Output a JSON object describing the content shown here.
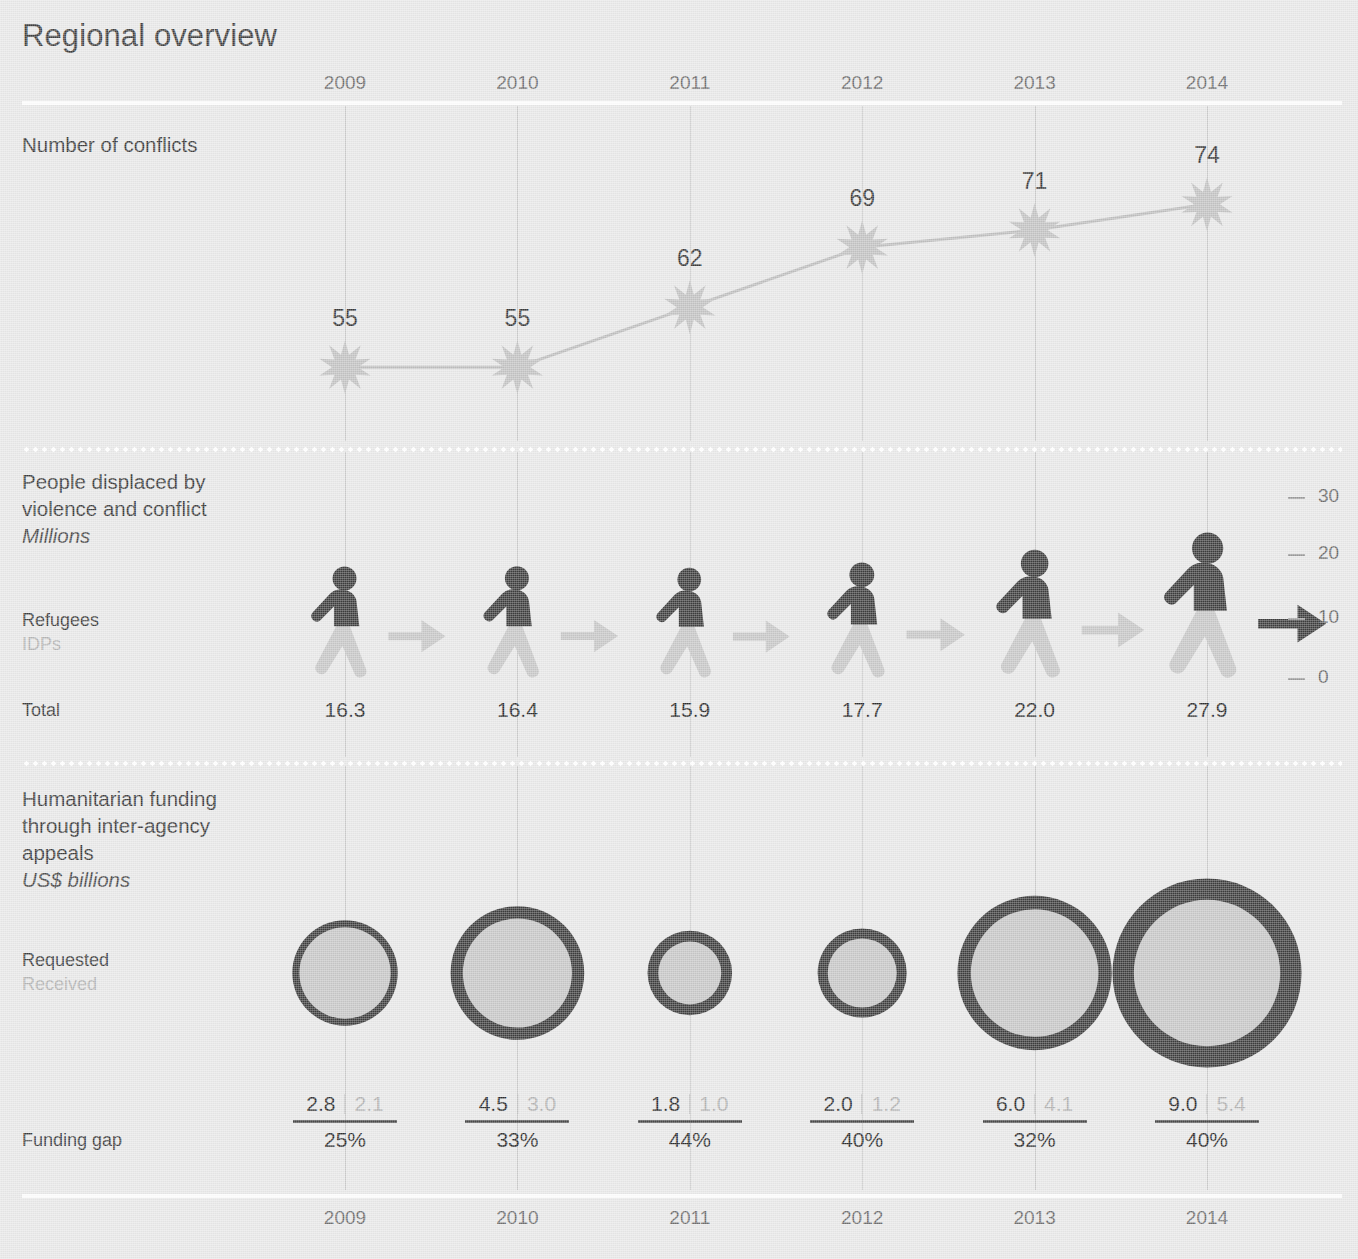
{
  "title": "Regional overview",
  "years": [
    "2009",
    "2010",
    "2011",
    "2012",
    "2013",
    "2014"
  ],
  "sections": {
    "conflicts": {
      "label": "Number of conflicts"
    },
    "displacement": {
      "label_line1": "People displaced by",
      "label_line2": "violence and conflict",
      "unit": "Millions",
      "series_label_refugees": "Refugees",
      "series_label_idps": "IDPs",
      "total_label": "Total",
      "axis_ticks": [
        "30",
        "20",
        "10",
        "0"
      ]
    },
    "funding": {
      "label_line1": "Humanitarian funding",
      "label_line2": "through inter-agency",
      "label_line3": "appeals",
      "unit": "US$ billions",
      "series_label_requested": "Requested",
      "series_label_received": "Received",
      "gap_label": "Funding gap"
    }
  },
  "colors": {
    "background": "#e8e8e8",
    "dark": "#3d3d3d",
    "light_gray": "#c6c6c6",
    "star": "#c2c2c2",
    "muted_text": "#b2b2b2",
    "gridline": "#c9c9c9",
    "rule_white": "#fdfdfd"
  },
  "chart_data": [
    {
      "type": "line",
      "title": "Number of conflicts",
      "categories": [
        "2009",
        "2010",
        "2011",
        "2012",
        "2013",
        "2014"
      ],
      "values": [
        55,
        55,
        62,
        69,
        71,
        74
      ],
      "xlabel": "",
      "ylabel": "Number of conflicts",
      "marker": "starburst",
      "grid": true,
      "legend": "none"
    },
    {
      "type": "pictogram",
      "title": "People displaced by violence and conflict",
      "unit": "Millions",
      "categories": [
        "2009",
        "2010",
        "2011",
        "2012",
        "2013",
        "2014"
      ],
      "series": [
        {
          "name": "Refugees",
          "values": [
            null,
            null,
            null,
            null,
            null,
            null
          ]
        },
        {
          "name": "IDPs",
          "values": [
            null,
            null,
            null,
            null,
            null,
            null
          ]
        }
      ],
      "totals": [
        16.3,
        16.4,
        15.9,
        17.7,
        22.0,
        27.9
      ],
      "ylim": [
        0,
        30
      ],
      "yticks": [
        0,
        10,
        20,
        30
      ],
      "ylabel": "Millions",
      "grid": true
    },
    {
      "type": "bubble",
      "title": "Humanitarian funding through inter-agency appeals",
      "unit": "US$ billions",
      "categories": [
        "2009",
        "2010",
        "2011",
        "2012",
        "2013",
        "2014"
      ],
      "series": [
        {
          "name": "Requested",
          "values": [
            2.8,
            4.5,
            1.8,
            2.0,
            6.0,
            9.0
          ]
        },
        {
          "name": "Received",
          "values": [
            2.1,
            3.0,
            1.0,
            1.2,
            4.1,
            5.4
          ]
        }
      ],
      "funding_gap_pct": [
        "25%",
        "33%",
        "44%",
        "40%",
        "32%",
        "40%"
      ],
      "grid": true
    }
  ]
}
